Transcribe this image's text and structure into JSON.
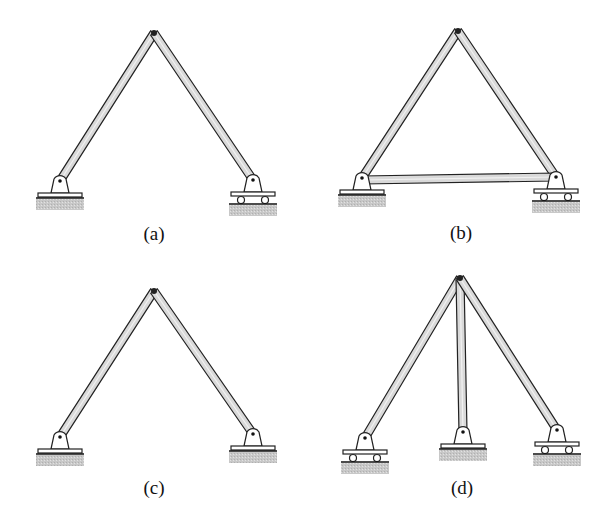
{
  "figure": {
    "colors": {
      "member_fill": "#d9d9d9",
      "member_stroke": "#222222",
      "ground_fill": "#c8c8c8",
      "support_fill": "#ffffff",
      "background": "#ffffff"
    },
    "panels": [
      {
        "id": "a",
        "label": "(a)",
        "label_pos": [
          154,
          240
        ],
        "apex": [
          154,
          33
        ],
        "members": [
          [
            [
              60,
              181
            ],
            [
              154,
              33
            ]
          ],
          [
            [
              154,
              33
            ],
            [
              253,
              180
            ]
          ]
        ],
        "supports": [
          {
            "type": "pin",
            "x": 60,
            "y": 181
          },
          {
            "type": "roller",
            "x": 253,
            "y": 180
          }
        ]
      },
      {
        "id": "b",
        "label": "(b)",
        "label_pos": [
          461,
          239
        ],
        "apex": [
          458,
          31
        ],
        "members": [
          [
            [
              362,
              178
            ],
            [
              458,
              31
            ]
          ],
          [
            [
              458,
              31
            ],
            [
              556,
              177
            ]
          ],
          [
            [
              362,
              180
            ],
            [
              556,
              177
            ]
          ]
        ],
        "supports": [
          {
            "type": "pin",
            "x": 362,
            "y": 178
          },
          {
            "type": "roller",
            "x": 556,
            "y": 177
          }
        ]
      },
      {
        "id": "c",
        "label": "(c)",
        "label_pos": [
          154,
          494
        ],
        "apex": [
          154,
          291
        ],
        "members": [
          [
            [
              60,
              437
            ],
            [
              154,
              291
            ]
          ],
          [
            [
              154,
              291
            ],
            [
              253,
              434
            ]
          ]
        ],
        "supports": [
          {
            "type": "pin",
            "x": 60,
            "y": 437
          },
          {
            "type": "pin",
            "x": 253,
            "y": 434
          }
        ]
      },
      {
        "id": "d",
        "label": "(d)",
        "label_pos": [
          462,
          494
        ],
        "apex": [
          460,
          278
        ],
        "members": [
          [
            [
              365,
              438
            ],
            [
              460,
              278
            ]
          ],
          [
            [
              460,
              278
            ],
            [
              463,
              432
            ]
          ],
          [
            [
              460,
              278
            ],
            [
              557,
              430
            ]
          ]
        ],
        "supports": [
          {
            "type": "roller",
            "x": 365,
            "y": 438
          },
          {
            "type": "pin",
            "x": 463,
            "y": 432
          },
          {
            "type": "roller",
            "x": 557,
            "y": 430
          }
        ]
      }
    ]
  }
}
